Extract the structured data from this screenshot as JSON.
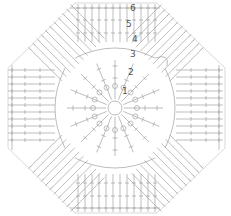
{
  "diagram": {
    "type": "crochet-chart",
    "shape": "octagon",
    "center": {
      "x": 115,
      "y": 108
    },
    "colors": {
      "stroke": "#9a9a9a",
      "label": "#555555",
      "background": "#ffffff"
    },
    "round_labels": [
      {
        "text": "6",
        "x": 130,
        "y": 4
      },
      {
        "text": "5",
        "x": 126,
        "y": 20
      },
      {
        "text": "4",
        "x": 132,
        "y": 35
      },
      {
        "text": "3",
        "x": 130,
        "y": 50
      },
      {
        "text": "2",
        "x": 128,
        "y": 68
      },
      {
        "text": "1",
        "x": 122,
        "y": 87
      }
    ],
    "rounds": 6
  }
}
